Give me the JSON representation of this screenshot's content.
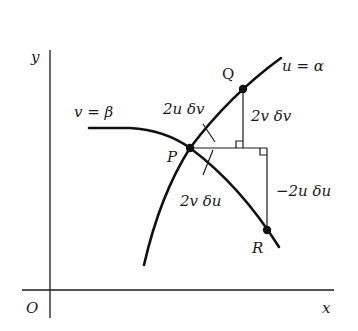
{
  "diagram": {
    "axes": {
      "x_label": "x",
      "y_label": "y",
      "origin_label": "O"
    },
    "curves": {
      "v_curve_label": "v = β",
      "u_curve_label": "u = α"
    },
    "points": {
      "P": "P",
      "Q": "Q",
      "R": "R"
    },
    "lengths": {
      "PQ": "2u δv",
      "PR": "2v δu",
      "Q_vertical": "2v δv",
      "R_vertical": "−2u δu"
    },
    "colors": {
      "ink": "#111111",
      "background": "#ffffff"
    }
  }
}
